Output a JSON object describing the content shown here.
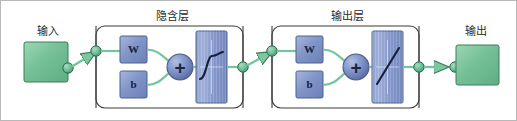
{
  "diagram": {
    "colors": {
      "green_fill": "#72c095",
      "green_fill_light": "#9ad7b3",
      "green_stroke": "#3f7d5d",
      "blue_fill": "#8195c8",
      "blue_fill_light": "#a3b3da",
      "blue_stroke": "#50608f",
      "node_fill": "#6cbd97",
      "node_stroke": "#2f6b4c",
      "layer_border": "#3a3a3a",
      "outer_border": "#b8b8b8",
      "text": "#2b2b2b",
      "background": "#ffffff"
    },
    "input": {
      "label": "输入",
      "block_name": "input-block"
    },
    "output": {
      "label": "输出",
      "block_name": "output-block"
    },
    "layers": [
      {
        "id": "hidden",
        "title": "隐含层",
        "weight_label": "W",
        "bias_label": "b",
        "sum_label": "+",
        "activation": "sigmoid"
      },
      {
        "id": "output",
        "title": "输出层",
        "weight_label": "W",
        "bias_label": "b",
        "sum_label": "+",
        "activation": "linear"
      }
    ]
  }
}
